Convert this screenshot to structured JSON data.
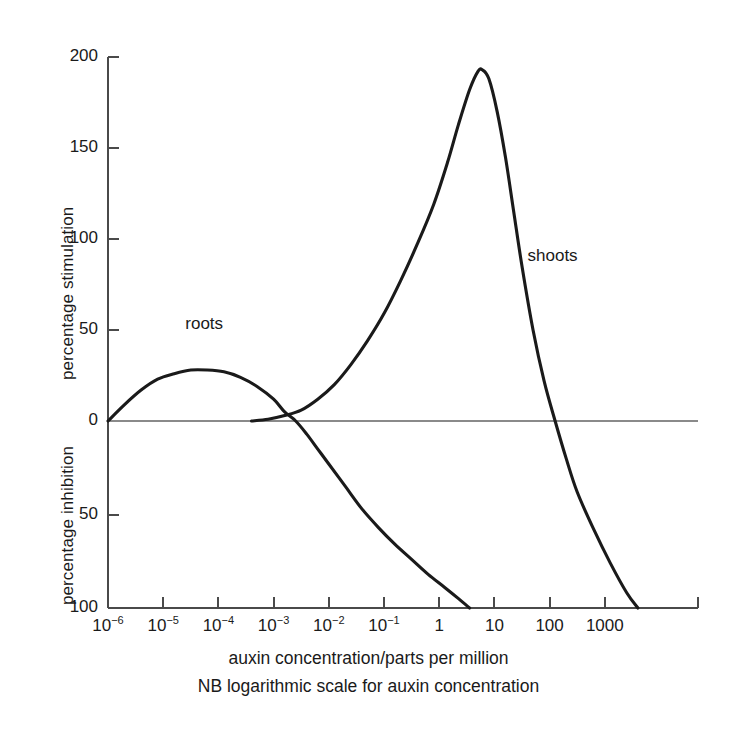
{
  "chart_data": {
    "type": "line",
    "title": "",
    "subtitle": "",
    "xlabel": "auxin concentration/parts per million",
    "xlabel_note": "NB logarithmic scale for auxin concentration",
    "ylabel_upper": "percentage stimulation",
    "ylabel_lower": "percentage inhibition",
    "x_scale": "log10",
    "xlim": [
      -6.2,
      4.0
    ],
    "ylim": [
      -100,
      200
    ],
    "grid": false,
    "legend_position": "inline-annotation",
    "x_tick_labels": [
      "10⁻⁶",
      "10⁻⁵",
      "10⁻⁴",
      "10⁻³",
      "10⁻²",
      "10⁻¹",
      "1",
      "10",
      "100",
      "1000"
    ],
    "x_tick_bases": [
      "10",
      "10",
      "10",
      "10",
      "10",
      "10",
      "1",
      "10",
      "100",
      "1000"
    ],
    "x_tick_exponents": [
      "-6",
      "-5",
      "-4",
      "-3",
      "-2",
      "-1",
      "",
      "",
      "",
      ""
    ],
    "x_tick_values": [
      -6,
      -5,
      -4,
      -3,
      -2,
      -1,
      0,
      1,
      2,
      3
    ],
    "y_tick_labels_upper": [
      "200",
      "150",
      "100",
      "50",
      "0"
    ],
    "y_tick_values_upper": [
      200,
      150,
      100,
      50,
      0
    ],
    "y_tick_labels_lower": [
      "50",
      "100"
    ],
    "y_tick_values_lower": [
      -50,
      -100
    ],
    "zero_line": 0,
    "series": [
      {
        "name": "roots",
        "label": "roots",
        "color": "#1a1a1a",
        "points": [
          [
            -6.0,
            0
          ],
          [
            -5.7,
            9
          ],
          [
            -5.4,
            17
          ],
          [
            -5.1,
            23
          ],
          [
            -4.8,
            26
          ],
          [
            -4.5,
            28
          ],
          [
            -4.2,
            28
          ],
          [
            -3.9,
            27
          ],
          [
            -3.6,
            24
          ],
          [
            -3.3,
            19
          ],
          [
            -3.0,
            12
          ],
          [
            -2.8,
            5
          ],
          [
            -2.6,
            0
          ],
          [
            -2.4,
            -7
          ],
          [
            -2.2,
            -15
          ],
          [
            -2.0,
            -23
          ],
          [
            -1.7,
            -35
          ],
          [
            -1.4,
            -47
          ],
          [
            -1.1,
            -57
          ],
          [
            -0.8,
            -66
          ],
          [
            -0.5,
            -74
          ],
          [
            -0.2,
            -82
          ],
          [
            0.1,
            -89
          ],
          [
            0.35,
            -95
          ],
          [
            0.55,
            -100
          ]
        ]
      },
      {
        "name": "shoots",
        "label": "shoots",
        "color": "#1a1a1a",
        "points": [
          [
            -3.4,
            0
          ],
          [
            -3.1,
            1
          ],
          [
            -2.8,
            3
          ],
          [
            -2.5,
            6
          ],
          [
            -2.2,
            12
          ],
          [
            -1.9,
            20
          ],
          [
            -1.6,
            31
          ],
          [
            -1.3,
            44
          ],
          [
            -1.0,
            59
          ],
          [
            -0.7,
            77
          ],
          [
            -0.4,
            97
          ],
          [
            -0.1,
            119
          ],
          [
            0.15,
            142
          ],
          [
            0.35,
            163
          ],
          [
            0.55,
            182
          ],
          [
            0.7,
            192
          ],
          [
            0.78,
            193
          ],
          [
            0.9,
            188
          ],
          [
            1.05,
            170
          ],
          [
            1.2,
            145
          ],
          [
            1.35,
            115
          ],
          [
            1.5,
            85
          ],
          [
            1.7,
            50
          ],
          [
            1.9,
            22
          ],
          [
            2.1,
            0
          ],
          [
            2.3,
            -20
          ],
          [
            2.5,
            -38
          ],
          [
            2.8,
            -58
          ],
          [
            3.1,
            -76
          ],
          [
            3.4,
            -92
          ],
          [
            3.6,
            -100
          ]
        ]
      }
    ],
    "annotations": [
      {
        "text": "roots",
        "x": -4.6,
        "y": 53
      },
      {
        "text": "shoots",
        "x": 1.6,
        "y": 90
      }
    ]
  },
  "colors": {
    "curve": "#1a1a1a",
    "axis": "#4a4a4a",
    "zero_line": "#8a8a8a",
    "background": "#ffffff",
    "text": "#1a1a1a"
  }
}
